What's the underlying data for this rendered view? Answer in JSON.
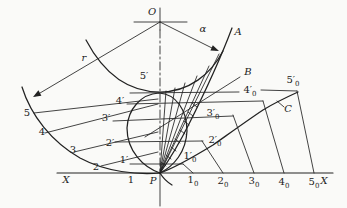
{
  "colors": {
    "ink": "#222222",
    "paper": "#fafaf8"
  },
  "labels": {
    "O": {
      "text": "O"
    },
    "alpha": {
      "text": "α"
    },
    "A": {
      "text": "A"
    },
    "r": {
      "text": "r"
    },
    "B": {
      "text": "B"
    },
    "C": {
      "text": "C"
    },
    "P": {
      "text": "P"
    },
    "X_left": {
      "text": "X"
    },
    "X_right": {
      "text": "X"
    },
    "p5": {
      "text": "5"
    },
    "p4": {
      "text": "4"
    },
    "p3": {
      "text": "3"
    },
    "p2": {
      "text": "2"
    },
    "p1": {
      "text": "1"
    },
    "pp5": {
      "text": "5′"
    },
    "pp4": {
      "text": "4′"
    },
    "pp3": {
      "text": "3′"
    },
    "pp2": {
      "text": "2′"
    },
    "pp1": {
      "text": "1′"
    },
    "b1": {
      "text": "1",
      "sub": "0"
    },
    "b2": {
      "text": "2",
      "sub": "0"
    },
    "b3": {
      "text": "3",
      "sub": "0"
    },
    "b4": {
      "text": "4",
      "sub": "0"
    },
    "b5": {
      "text": "5",
      "sub": "0"
    },
    "rp1": {
      "text": "1′",
      "sub": "0"
    },
    "rp2": {
      "text": "2′",
      "sub": "0"
    },
    "rp3": {
      "text": "3′",
      "sub": "0"
    },
    "rp4": {
      "text": "4′",
      "sub": "0"
    },
    "rp5": {
      "text": "5′",
      "sub": "0"
    }
  }
}
